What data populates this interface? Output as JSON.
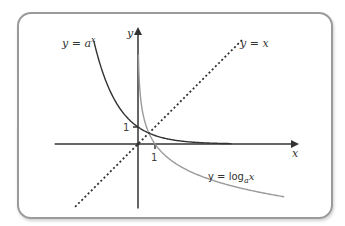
{
  "figure": {
    "labels": {
      "y_axis": "y",
      "x_axis": "x",
      "exp_curve": {
        "pre": "y = a",
        "sup": "x"
      },
      "identity_line": "y = x",
      "log_curve": {
        "pre": "y = log",
        "sub": "a",
        "post": "x"
      },
      "tick_y": "1",
      "tick_x": "1"
    },
    "colors": {
      "frame": "#9a9a9a",
      "axes": "#333333",
      "exp_curve": "#333333",
      "log_curve": "#9a9a9a",
      "identity_line": "#333333"
    }
  },
  "chart_data": {
    "type": "line",
    "title": "",
    "xlabel": "x",
    "ylabel": "y",
    "xlim": [
      -4.9,
      9.3
    ],
    "ylim": [
      -3.8,
      6.8
    ],
    "base_a": 0.5,
    "series": [
      {
        "name": "y = a^x",
        "function": "a^x",
        "x_range": [
          -2.6,
          5.5
        ],
        "style": "solid-dark"
      },
      {
        "name": "y = log_a x",
        "function": "log_a(x)",
        "x_range": [
          0.02,
          8.6
        ],
        "style": "solid-grey"
      },
      {
        "name": "y = x",
        "function": "x",
        "x_range": [
          -3.7,
          6.2
        ],
        "style": "dashed"
      }
    ],
    "ticks": {
      "x": [
        1
      ],
      "y": [
        1
      ]
    },
    "grid": false,
    "legend": "none (inline labels)"
  }
}
